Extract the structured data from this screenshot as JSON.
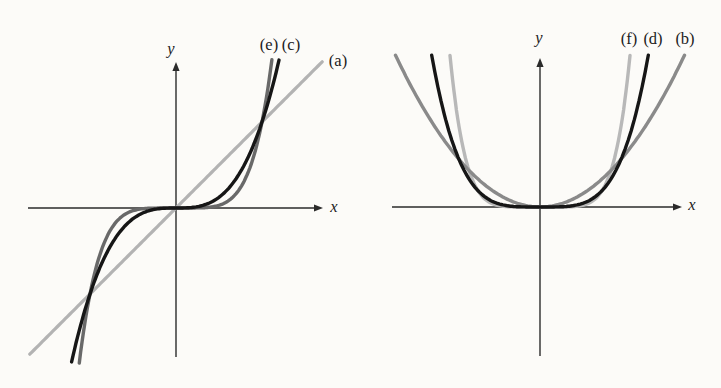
{
  "figure": {
    "background": "#fcfbf8",
    "left_graph": {
      "y_axis_label": "y",
      "x_axis_label": "x",
      "curve_labels": {
        "e": "(e)",
        "c": "(c)",
        "a": "(a)"
      }
    },
    "right_graph": {
      "y_axis_label": "y",
      "x_axis_label": "x",
      "curve_labels": {
        "f": "(f)",
        "d": "(d)",
        "b": "(b)"
      }
    }
  },
  "chart_data": [
    {
      "type": "line",
      "title": "",
      "xlabel": "x",
      "ylabel": "y",
      "grid": false,
      "legend_position": "labels-at-curve-ends",
      "axis_color": "#2b2b2b",
      "series": [
        {
          "id": "a",
          "label": "(a)",
          "equation": "y = x",
          "exponent": 1,
          "color": "#b3b3b3",
          "x_range": [
            -1.7,
            1.7
          ],
          "sample_points": [
            [
              -1.7,
              -1.7
            ],
            [
              -1,
              -1
            ],
            [
              0,
              0
            ],
            [
              1,
              1
            ],
            [
              1.7,
              1.7
            ]
          ],
          "render": {
            "u": 86,
            "width": 3.2
          }
        },
        {
          "id": "e",
          "label": "(e)",
          "equation": "y = x^5",
          "exponent": 5,
          "color": "#696969",
          "x_range": [
            -1.125,
            1.115
          ],
          "sample_points": [
            [
              -1.12,
              -1.76
            ],
            [
              -1,
              -1
            ],
            [
              -0.5,
              -0.03
            ],
            [
              0,
              0
            ],
            [
              0.5,
              0.03
            ],
            [
              1,
              1
            ],
            [
              1.11,
              1.68
            ]
          ],
          "render": {
            "u": 86,
            "width": 3.4
          }
        },
        {
          "id": "c",
          "label": "(c)",
          "equation": "y = x^3",
          "exponent": 3,
          "color": "#161616",
          "x_range": [
            -1.214,
            1.198
          ],
          "sample_points": [
            [
              -1.21,
              -1.77
            ],
            [
              -1,
              -1
            ],
            [
              -0.5,
              -0.13
            ],
            [
              0,
              0
            ],
            [
              0.5,
              0.13
            ],
            [
              1,
              1
            ],
            [
              1.2,
              1.73
            ]
          ],
          "render": {
            "u": 86,
            "width": 3.4
          }
        }
      ],
      "render": {
        "origin": [
          176,
          208
        ],
        "v": 86,
        "x_axis": [
          28,
          323
        ],
        "y_axis": [
          357,
          62
        ],
        "axis_width": 1.4
      }
    },
    {
      "type": "line",
      "title": "",
      "xlabel": "x",
      "ylabel": "y",
      "grid": false,
      "legend_position": "labels-at-curve-ends",
      "axis_color": "#2b2b2b",
      "series": [
        {
          "id": "f",
          "label": "(f)",
          "equation": "y = x^6",
          "exponent": 6,
          "color": "#b8b8b8",
          "x_range": [
            -1.184,
            1.184
          ],
          "sample_points": [
            [
              -1.18,
              2.7
            ],
            [
              -1,
              1
            ],
            [
              -0.5,
              0.02
            ],
            [
              0,
              0
            ],
            [
              0.5,
              0.02
            ],
            [
              1,
              1
            ],
            [
              1.18,
              2.7
            ]
          ],
          "render": {
            "u": 76,
            "width": 3.4
          }
        },
        {
          "id": "b",
          "label": "(b)",
          "equation": "y = x^2",
          "exponent": 2,
          "color": "#8a8a8a",
          "x_range": [
            -1.661,
            1.661
          ],
          "sample_points": [
            [
              -1.66,
              2.76
            ],
            [
              -1,
              1
            ],
            [
              -0.5,
              0.25
            ],
            [
              0,
              0
            ],
            [
              0.5,
              0.25
            ],
            [
              1,
              1
            ],
            [
              1.66,
              2.76
            ]
          ],
          "render": {
            "u": 87,
            "width": 3.4
          }
        },
        {
          "id": "d",
          "label": "(d)",
          "equation": "y = x^4",
          "exponent": 4,
          "color": "#161616",
          "x_range": [
            -1.289,
            1.289
          ],
          "sample_points": [
            [
              -1.29,
              2.76
            ],
            [
              -1,
              1
            ],
            [
              -0.5,
              0.06
            ],
            [
              0,
              0
            ],
            [
              0.5,
              0.06
            ],
            [
              1,
              1
            ],
            [
              1.29,
              2.76
            ]
          ],
          "render": {
            "u": 84,
            "width": 3.4
          }
        }
      ],
      "render": {
        "origin": [
          540,
          207
        ],
        "v": 55,
        "x_axis": [
          392,
          682
        ],
        "y_axis": [
          356,
          58
        ],
        "axis_width": 1.4
      }
    }
  ]
}
